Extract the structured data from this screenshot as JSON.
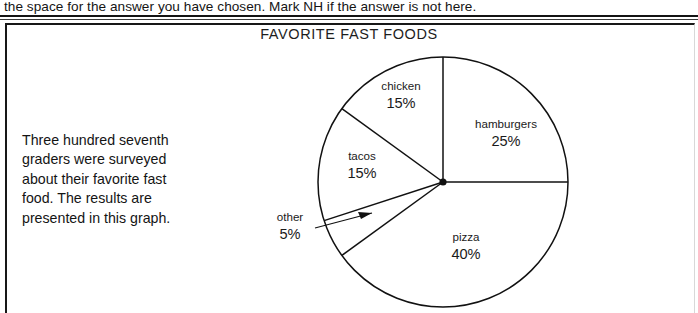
{
  "instruction": {
    "text": "the space for the answer you have chosen. Mark NH if the answer is not here."
  },
  "chart_title": "FAVORITE FAST FOODS",
  "problem_text": "Three hundred seventh graders were surveyed about their favorite fast food. The results are presented in this graph.",
  "chart_data": {
    "type": "pie",
    "title": "FAVORITE FAST FOODS",
    "legend": "none",
    "start_angle_deg": 0,
    "direction": "clockwise",
    "labels_inside": true,
    "slices": [
      {
        "name": "hamburgers",
        "percent": 25,
        "pct_label": "25%",
        "start_deg": 0,
        "end_deg": 90,
        "label_x": 506,
        "label_y": 128,
        "callout": false
      },
      {
        "name": "pizza",
        "percent": 40,
        "pct_label": "40%",
        "start_deg": 90,
        "end_deg": 234,
        "label_x": 466,
        "label_y": 241,
        "callout": false
      },
      {
        "name": "other",
        "percent": 5,
        "pct_label": "5%",
        "start_deg": 234,
        "end_deg": 252,
        "label_x": 290,
        "label_y": 221,
        "callout": true
      },
      {
        "name": "tacos",
        "percent": 15,
        "pct_label": "15%",
        "start_deg": 252,
        "end_deg": 306,
        "label_x": 362,
        "label_y": 160,
        "callout": false
      },
      {
        "name": "chicken",
        "percent": 15,
        "pct_label": "15%",
        "start_deg": 306,
        "end_deg": 360,
        "label_x": 401,
        "label_y": 90,
        "callout": false
      }
    ],
    "total_surveyed": 300,
    "colors": {
      "fill": "#ffffff",
      "stroke": "#111111",
      "text": "#1a1a1a"
    }
  }
}
